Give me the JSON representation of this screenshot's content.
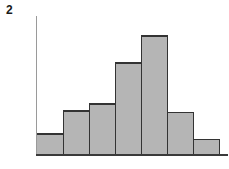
{
  "figure": {
    "label": "2",
    "background_color": "#ffffff"
  },
  "chart_data": {
    "type": "bar",
    "title": "",
    "subtitle": "",
    "xlabel": "",
    "ylabel": "",
    "categories": [
      "1",
      "2",
      "3",
      "4",
      "5",
      "6",
      "7"
    ],
    "values": [
      12,
      25,
      29,
      52,
      67,
      24,
      9
    ],
    "tick_labels": {
      "x": [],
      "y": []
    },
    "legend": {
      "entries": [],
      "position": "none"
    },
    "annotations": [],
    "grid": false,
    "xlim": [
      0,
      7
    ],
    "ylim": [
      0,
      78
    ],
    "bar_fill_color": "#b5b5b5",
    "bar_stroke_color": "#333333",
    "axis_color": "#9a9a9a",
    "baseline_color": "#3a3a3a",
    "axis_y_visible": true,
    "axis_x_visible": true,
    "bar_gap": 0
  },
  "geometry": {
    "axis_x": 36,
    "axis_top": 16,
    "baseline_y": 155,
    "baseline_right": 228,
    "bar_edges": [
      36,
      63,
      89,
      115,
      141,
      167,
      193,
      219
    ],
    "bar_tops": [
      143,
      130,
      126,
      103,
      88,
      131,
      146
    ]
  }
}
